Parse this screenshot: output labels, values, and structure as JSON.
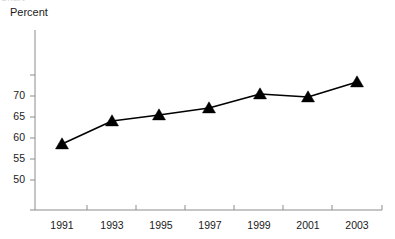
{
  "chart_data": {
    "type": "line",
    "title": "",
    "subtitle": "",
    "ylabel": "Percent",
    "xlabel": "",
    "categories": [
      "1991",
      "1993",
      "1995",
      "1997",
      "1999",
      "2001",
      "2003"
    ],
    "x": [
      1991,
      1993,
      1995,
      1997,
      1999,
      2001,
      2003
    ],
    "series": [
      {
        "name": "Percent",
        "values": [
          54.5,
          59.4,
          60.8,
          62.5,
          65.9,
          65.3,
          68.8
        ],
        "color": "#000000",
        "marker": "triangle",
        "line_width": 1.6
      }
    ],
    "ylim": [
      45,
      77.5
    ],
    "ytick_values": [
      75,
      70,
      65,
      60,
      55,
      50,
      45
    ],
    "ytick_labels": [
      "",
      "70",
      "65",
      "60",
      "55",
      "50",
      ""
    ],
    "xlim": [
      1990.2,
      2004.6
    ],
    "xtick_values": [
      1992,
      1994,
      1996,
      1998,
      2000,
      2002
    ],
    "grid": false,
    "legend": false,
    "legend_position": "none",
    "axis_color": "#8c8c8c",
    "text_color": "#1a1a1a",
    "background": "#ffffff",
    "annotations": []
  },
  "geometry": {
    "plot_left": 35,
    "plot_right": 382,
    "plot_top": 30,
    "plot_bottom": 210,
    "point_x_px": [
      62,
      112,
      159,
      209,
      260,
      308,
      357
    ],
    "point_y_px": [
      144,
      121,
      115,
      108,
      94,
      97,
      82
    ],
    "ytick_y_px": [
      75,
      96,
      117,
      138,
      159,
      180
    ],
    "ytick_px_labeled": [
      96,
      117,
      138,
      159
    ],
    "xtick_x_px": [
      87,
      136,
      185,
      234,
      283,
      332
    ],
    "xlabel_x_px": [
      62,
      112,
      161,
      210,
      259,
      308,
      357
    ],
    "marker_size": 6.5
  },
  "header": {
    "clipped_top_row": "Chart"
  }
}
